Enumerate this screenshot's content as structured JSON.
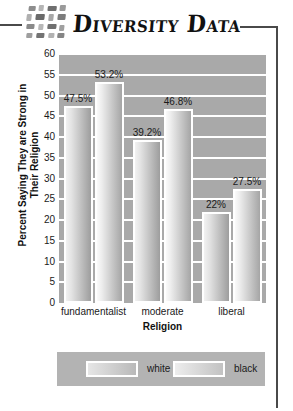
{
  "header": {
    "title": "Diversity Data",
    "mosaic_icon": "mosaic-tiles-icon"
  },
  "chart_data": {
    "type": "bar",
    "title": "Diversity Data",
    "xlabel": "Religion",
    "ylabel": "Percent Saying They are Strong in Their Religion",
    "categories": [
      "fundamentalist",
      "moderate",
      "liberal"
    ],
    "series": [
      {
        "name": "white",
        "values": [
          47.5,
          39.2,
          22
        ],
        "labels": [
          "47.5%",
          "39.2%",
          "22%"
        ]
      },
      {
        "name": "black",
        "values": [
          53.2,
          46.8,
          27.5
        ],
        "labels": [
          "53.2%",
          "46.8%",
          "27.5%"
        ]
      }
    ],
    "ylim": [
      0,
      60
    ],
    "yticks": [
      0,
      5,
      10,
      15,
      20,
      25,
      30,
      35,
      40,
      45,
      50,
      55,
      60
    ],
    "ytick_labels": [
      "0",
      "5",
      "10",
      "15",
      "20",
      "25",
      "30",
      "35",
      "40",
      "45",
      "50",
      "55",
      "60"
    ],
    "grid": true,
    "legend_position": "bottom",
    "plot_background": "#a9a9a9",
    "gridline_color": "#ffffff"
  },
  "legend": {
    "items": [
      {
        "label": "white",
        "swatch": "white"
      },
      {
        "label": "black",
        "swatch": "black"
      }
    ]
  }
}
